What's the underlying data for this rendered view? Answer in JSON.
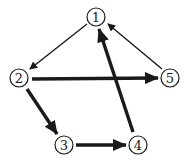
{
  "diagram": {
    "type": "directed-graph",
    "nodes": [
      {
        "id": "1",
        "label": "1",
        "x": 96,
        "y": 17
      },
      {
        "id": "2",
        "label": "2",
        "x": 19,
        "y": 78
      },
      {
        "id": "3",
        "label": "3",
        "x": 64,
        "y": 145
      },
      {
        "id": "4",
        "label": "4",
        "x": 138,
        "y": 145
      },
      {
        "id": "5",
        "label": "5",
        "x": 170,
        "y": 78
      }
    ],
    "edges": [
      {
        "from": "1",
        "to": "2",
        "weight": "thin"
      },
      {
        "from": "5",
        "to": "1",
        "weight": "thin"
      },
      {
        "from": "2",
        "to": "5",
        "weight": "thick"
      },
      {
        "from": "2",
        "to": "3",
        "weight": "thick"
      },
      {
        "from": "3",
        "to": "4",
        "weight": "thick"
      },
      {
        "from": "4",
        "to": "1",
        "weight": "thick"
      }
    ],
    "colors": {
      "stroke": "#1a1a1a",
      "background": "#ffffff"
    }
  }
}
